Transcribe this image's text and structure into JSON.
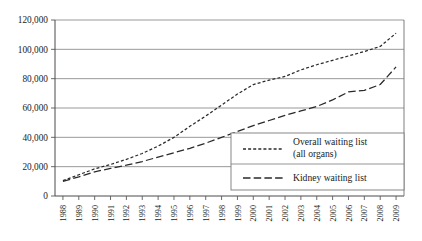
{
  "chart_data": {
    "type": "line",
    "title": "",
    "xlabel": "",
    "ylabel": "",
    "grid": true,
    "legend_position": "lower-right",
    "ylim": [
      0,
      120000
    ],
    "yticks": [
      0,
      20000,
      40000,
      60000,
      80000,
      100000,
      120000
    ],
    "ytick_labels": [
      "0",
      "20,000",
      "40,000",
      "60,000",
      "80,000",
      "100,000",
      "120,000"
    ],
    "categories": [
      "1988",
      "1989",
      "1990",
      "1991",
      "1992",
      "1993",
      "1994",
      "1995",
      "1996",
      "1997",
      "1998",
      "1999",
      "2000",
      "2001",
      "2002",
      "2003",
      "2004",
      "2005",
      "2006",
      "2007",
      "2008",
      "2009"
    ],
    "x": [
      1988,
      1989,
      1990,
      1991,
      1992,
      1993,
      1994,
      1995,
      1996,
      1997,
      1998,
      1999,
      2000,
      2001,
      2002,
      2003,
      2004,
      2005,
      2006,
      2007,
      2008,
      2009
    ],
    "series": [
      {
        "name": "Overall waiting list (all organs)",
        "dash": "short",
        "values": [
          10500,
          14500,
          18500,
          21500,
          25000,
          29000,
          34000,
          40000,
          47500,
          54500,
          62000,
          69500,
          76000,
          79000,
          81500,
          86000,
          89500,
          92500,
          95500,
          98500,
          102000,
          111000
        ]
      },
      {
        "name": "Kidney waiting list",
        "dash": "long",
        "values": [
          10000,
          13000,
          16500,
          18800,
          21000,
          23500,
          26500,
          29500,
          32500,
          36000,
          40000,
          44000,
          48000,
          51500,
          55000,
          58000,
          61000,
          65500,
          71000,
          72000,
          76000,
          88000
        ]
      }
    ],
    "legend_entries": [
      {
        "label_line1": "Overall waiting list",
        "label_line2": "(all organs)",
        "dash": "short"
      },
      {
        "label_line1": "Kidney waiting list",
        "label_line2": "",
        "dash": "long"
      }
    ],
    "colors": {
      "series_stroke": "#2a2a2a",
      "gridline": "#8d8d8d",
      "axis": "#4a4a4a",
      "background": "#ffffff"
    }
  }
}
